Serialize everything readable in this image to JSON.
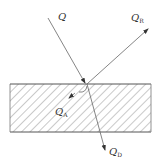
{
  "diagram": {
    "type": "energy flow at surface (incident, reflected, absorbed, transmitted)",
    "labels": {
      "incident": {
        "main": "Q",
        "sub": ""
      },
      "reflected": {
        "main": "Q",
        "sub": "R"
      },
      "absorbed": {
        "main": "Q",
        "sub": "A"
      },
      "transmitted": {
        "main": "Q",
        "sub": "D"
      }
    },
    "colors": {
      "line": "#555555",
      "hatch": "#777777",
      "text": "#333333",
      "background": "#ffffff"
    }
  }
}
